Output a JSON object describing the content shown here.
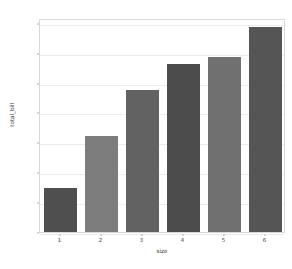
{
  "figure": {
    "background": "#ffffff",
    "plot_background": "#ffffff",
    "frame_color": "#d8d8d8",
    "grid_color": "#ececec",
    "tick_color": "#b0b0b0",
    "text_color": "#3d3d3d"
  },
  "chart_data": {
    "type": "bar",
    "title": "",
    "xlabel": "size",
    "ylabel": "total_bill",
    "categories": [
      "1",
      "2",
      "3",
      "4",
      "5",
      "6"
    ],
    "values": [
      7.4,
      16.1,
      23.8,
      28.1,
      29.2,
      34.3
    ],
    "bar_colors": [
      "#4f4f4f",
      "#7d7d7d",
      "#626262",
      "#4c4c4c",
      "#707070",
      "#555555"
    ],
    "ylim": [
      0,
      35.8
    ],
    "yticks": [
      0,
      5,
      10,
      15,
      20,
      25,
      30,
      35
    ],
    "ytick_labels": [
      "0",
      "5",
      "10",
      "15",
      "20",
      "25",
      "30",
      "35"
    ],
    "xtick_labels": [
      "1",
      "2",
      "3",
      "4",
      "5",
      "6"
    ],
    "grid": true,
    "grid_axis": "y",
    "legend": false,
    "legend_position": "none",
    "bar_width_ratio": 0.8
  }
}
